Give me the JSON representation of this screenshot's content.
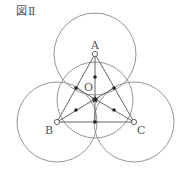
{
  "figure": {
    "label": "図Ⅱ"
  },
  "diagram": {
    "points": {
      "A": {
        "label": "A",
        "x": 95,
        "y": 54
      },
      "B": {
        "label": "B",
        "x": 57,
        "y": 122
      },
      "C": {
        "label": "C",
        "x": 134,
        "y": 122
      },
      "O": {
        "label": "O",
        "x": 95,
        "y": 99
      }
    },
    "circles": [
      {
        "name": "circle-A",
        "cx": 95,
        "cy": 54,
        "r": 41
      },
      {
        "name": "circle-B",
        "cx": 57,
        "cy": 122,
        "r": 40
      },
      {
        "name": "circle-C",
        "cx": 134,
        "cy": 122,
        "r": 40
      },
      {
        "name": "circle-center",
        "cx": 95,
        "cy": 100,
        "r": 38
      }
    ],
    "stroke_color": "#8a8a8a",
    "line_color": "#555555",
    "dot_color": "#222222"
  }
}
